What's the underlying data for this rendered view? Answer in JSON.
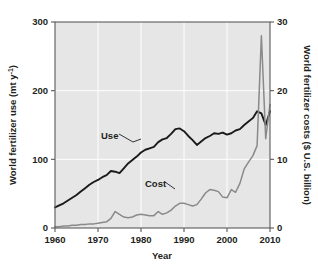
{
  "chart_data": {
    "type": "line",
    "title": "",
    "xlabel": "Year",
    "ylabel": "World fertilizer use (mt y⁻¹)",
    "y2label": "World fertilizer costs ($ U.S. billion)",
    "xlim": [
      1960,
      2010
    ],
    "ylim": [
      0,
      300
    ],
    "y2lim": [
      0,
      30
    ],
    "xticks": [
      "1960",
      "1970",
      "1980",
      "1990",
      "2000",
      "2010"
    ],
    "xtick_values": [
      1960,
      1970,
      1980,
      1990,
      2000,
      2010
    ],
    "yticks": [
      "0",
      "100",
      "200",
      "300"
    ],
    "ytick_values": [
      0,
      100,
      200,
      300
    ],
    "y2ticks": [
      "0",
      "10",
      "20",
      "30"
    ],
    "y2tick_values": [
      0,
      10,
      20,
      30
    ],
    "grid": true,
    "grid_color": "#ffffff",
    "plot_background": "#e6e6e6",
    "legend_position": "inline-annotation",
    "series": [
      {
        "name": "Use",
        "axis": "left",
        "units": "mt y-1",
        "color": "#1a1a1a",
        "x": [
          1960,
          1961,
          1962,
          1963,
          1964,
          1965,
          1966,
          1967,
          1968,
          1969,
          1970,
          1971,
          1972,
          1973,
          1974,
          1975,
          1976,
          1977,
          1978,
          1979,
          1980,
          1981,
          1982,
          1983,
          1984,
          1985,
          1986,
          1987,
          1988,
          1989,
          1990,
          1991,
          1992,
          1993,
          1994,
          1995,
          1996,
          1997,
          1998,
          1999,
          2000,
          2001,
          2002,
          2003,
          2004,
          2005,
          2006,
          2007,
          2008,
          2009,
          2010
        ],
        "values": [
          30,
          33,
          36,
          40,
          44,
          48,
          53,
          58,
          63,
          67,
          70,
          74,
          77,
          83,
          82,
          80,
          87,
          94,
          99,
          104,
          110,
          114,
          116,
          118,
          125,
          129,
          131,
          137,
          144,
          145,
          141,
          134,
          128,
          121,
          126,
          131,
          134,
          138,
          137,
          139,
          136,
          138,
          142,
          144,
          150,
          155,
          160,
          170,
          167,
          150,
          170
        ]
      },
      {
        "name": "Cost",
        "axis": "right",
        "units": "$ U.S. billion",
        "color": "#8a8a8a",
        "x": [
          1960,
          1961,
          1962,
          1963,
          1964,
          1965,
          1966,
          1967,
          1968,
          1969,
          1970,
          1971,
          1972,
          1973,
          1974,
          1975,
          1976,
          1977,
          1978,
          1979,
          1980,
          1981,
          1982,
          1983,
          1984,
          1985,
          1986,
          1987,
          1988,
          1989,
          1990,
          1991,
          1992,
          1993,
          1994,
          1995,
          1996,
          1997,
          1998,
          1999,
          2000,
          2001,
          2002,
          2003,
          2004,
          2005,
          2006,
          2007,
          2008,
          2009,
          2010
        ],
        "values": [
          0.2,
          0.2,
          0.3,
          0.3,
          0.4,
          0.4,
          0.5,
          0.5,
          0.6,
          0.6,
          0.7,
          0.8,
          0.9,
          1.4,
          2.4,
          2.0,
          1.6,
          1.5,
          1.6,
          1.9,
          2.0,
          1.9,
          1.8,
          1.8,
          2.4,
          2.0,
          2.2,
          2.6,
          3.2,
          3.6,
          3.6,
          3.4,
          3.2,
          3.4,
          4.2,
          5.1,
          5.6,
          5.5,
          5.3,
          4.5,
          4.4,
          5.6,
          5.2,
          6.5,
          8.6,
          9.6,
          10.5,
          12.0,
          28.0,
          13.0,
          18.0
        ]
      }
    ],
    "annotations": [
      {
        "text": "Use",
        "x_px": 101,
        "y_px": 136
      },
      {
        "text": "Cost",
        "x_px": 146,
        "y_px": 184
      }
    ]
  },
  "labels": {
    "y_axis_left": "World fertilizer use (mt y",
    "y_axis_left_sup": "-1",
    "y_axis_left_tail": ")",
    "y_axis_right": "World fertilizer costs ($ U.S. billion)",
    "x_axis": "Year",
    "series_use": "Use",
    "series_cost": "Cost"
  },
  "ticks": {
    "x": [
      "1960",
      "1970",
      "1980",
      "1990",
      "2000",
      "2010"
    ],
    "y_left": [
      "300",
      "200",
      "100",
      "0"
    ],
    "y_right": [
      "30",
      "20",
      "10",
      "0"
    ]
  },
  "colors": {
    "use_line": "#1a1a1a",
    "cost_line": "#8a8a8a",
    "plot_bg": "#e6e6e6",
    "grid": "#ffffff",
    "frame": "#5a5a5a",
    "text": "#231f20"
  }
}
